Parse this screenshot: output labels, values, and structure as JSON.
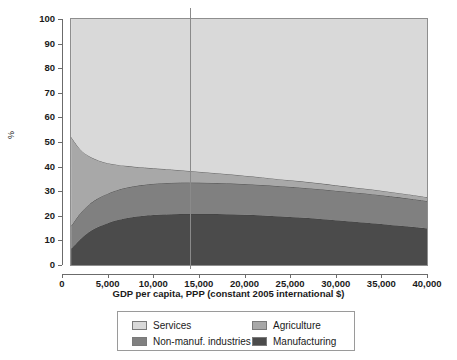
{
  "chart_data": {
    "type": "area",
    "title": "",
    "subtitle": "",
    "xlabel": "GDP per capita, PPP (constant 2005 international $)",
    "ylabel": "%",
    "stacked": true,
    "stack_order_bottom_to_top": [
      "Manufacturing",
      "Non-manuf. industries",
      "Agriculture",
      "Services"
    ],
    "xlim": [
      0,
      40000
    ],
    "ylim": [
      0,
      100
    ],
    "xticks": [
      0,
      5000,
      10000,
      15000,
      20000,
      25000,
      30000,
      35000,
      40000
    ],
    "xtick_labels": [
      "0",
      "5,000",
      "10,000",
      "15,000",
      "20,000",
      "25,000",
      "30,000",
      "35,000",
      "40,000"
    ],
    "yticks": [
      0,
      10,
      20,
      30,
      40,
      50,
      60,
      70,
      80,
      90,
      100
    ],
    "ytick_labels": [
      "0",
      "10",
      "20",
      "30",
      "40",
      "50",
      "60",
      "70",
      "80",
      "90",
      "100"
    ],
    "grid": false,
    "legend_position": "below-axes",
    "data_x_start": 1000,
    "data_x_end": 40000,
    "x": [
      1000,
      2000,
      3000,
      4000,
      5000,
      6000,
      7000,
      8000,
      9000,
      10000,
      12000,
      14000,
      16000,
      18000,
      20000,
      22000,
      24000,
      26000,
      28000,
      30000,
      32000,
      34000,
      36000,
      38000,
      40000
    ],
    "series": [
      {
        "name": "Manufacturing",
        "color": "#4b4b4b",
        "values": [
          6.5,
          10.5,
          13.5,
          15.5,
          17.0,
          18.2,
          19.0,
          19.6,
          20.0,
          20.3,
          20.6,
          20.7,
          20.7,
          20.6,
          20.4,
          20.1,
          19.7,
          19.3,
          18.8,
          18.2,
          17.6,
          17.0,
          16.3,
          15.6,
          14.8
        ]
      },
      {
        "name": "Non-manuf. industries",
        "color": "#808080",
        "values": [
          9.3,
          10.5,
          11.2,
          11.7,
          12.0,
          12.2,
          12.4,
          12.5,
          12.6,
          12.7,
          12.8,
          12.8,
          12.7,
          12.6,
          12.5,
          12.4,
          12.3,
          12.2,
          12.1,
          12.0,
          11.9,
          11.8,
          11.6,
          11.4,
          11.2
        ]
      },
      {
        "name": "Agriculture",
        "color": "#a8a8a8",
        "values": [
          36.2,
          26.0,
          19.5,
          15.3,
          12.4,
          10.4,
          8.9,
          7.8,
          7.0,
          6.3,
          5.4,
          4.7,
          4.2,
          3.8,
          3.4,
          3.1,
          2.8,
          2.6,
          2.4,
          2.2,
          2.0,
          1.9,
          1.8,
          1.7,
          1.6
        ]
      },
      {
        "name": "Services",
        "color": "#d9d9d9",
        "values": [
          48.0,
          53.0,
          55.8,
          57.5,
          58.6,
          59.2,
          59.7,
          60.1,
          60.4,
          60.7,
          61.2,
          61.8,
          62.4,
          63.0,
          63.7,
          64.4,
          65.2,
          65.9,
          66.7,
          67.6,
          68.5,
          69.3,
          70.3,
          71.3,
          72.4
        ]
      }
    ],
    "cumulative_top_boundaries": {
      "manufacturing_top": [
        6.5,
        10.5,
        13.5,
        15.5,
        17.0,
        18.2,
        19.0,
        19.6,
        20.0,
        20.3,
        20.6,
        20.7,
        20.7,
        20.6,
        20.4,
        20.1,
        19.7,
        19.3,
        18.8,
        18.2,
        17.6,
        17.0,
        16.3,
        15.6,
        14.8
      ],
      "nonmanuf_top": [
        15.8,
        21.0,
        24.7,
        27.2,
        29.0,
        30.4,
        31.4,
        32.1,
        32.6,
        33.0,
        33.4,
        33.5,
        33.4,
        33.2,
        32.9,
        32.5,
        32.0,
        31.5,
        30.9,
        30.2,
        29.5,
        28.8,
        27.9,
        27.0,
        26.0
      ],
      "agriculture_top": [
        52.0,
        47.0,
        44.2,
        42.5,
        41.4,
        40.8,
        40.3,
        39.9,
        39.6,
        39.3,
        38.8,
        38.2,
        37.6,
        37.0,
        36.3,
        35.6,
        34.8,
        34.1,
        33.3,
        32.4,
        31.5,
        30.7,
        29.7,
        28.7,
        27.6
      ],
      "services_top": [
        100,
        100,
        100,
        100,
        100,
        100,
        100,
        100,
        100,
        100,
        100,
        100,
        100,
        100,
        100,
        100,
        100,
        100,
        100,
        100,
        100,
        100,
        100,
        100,
        100
      ]
    },
    "annotations": [
      {
        "name": "reference-line",
        "type": "vline",
        "x_value": 14000,
        "color": "#8a8a8a"
      }
    ]
  },
  "axes": {
    "y_title": "%",
    "x_title": "GDP per capita, PPP (constant 2005 international $)",
    "ytick_labels": [
      "100",
      "90",
      "80",
      "70",
      "60",
      "50",
      "40",
      "30",
      "20",
      "10",
      "0"
    ],
    "xtick_labels": [
      "0",
      "5,000",
      "10,000",
      "15,000",
      "20,000",
      "25,000",
      "30,000",
      "35,000",
      "40,000"
    ]
  },
  "legend": {
    "entries": [
      {
        "label": "Services",
        "color": "#d9d9d9"
      },
      {
        "label": "Agriculture",
        "color": "#a8a8a8"
      },
      {
        "label": "Non-manuf. industries",
        "color": "#808080"
      },
      {
        "label": "Manufacturing",
        "color": "#4b4b4b"
      }
    ]
  },
  "colors": {
    "services": "#d9d9d9",
    "agriculture": "#a8a8a8",
    "non_manuf_industries": "#808080",
    "manufacturing": "#4b4b4b",
    "axis": "#6b6b6b",
    "frame": "#8e8e8e",
    "reference_line": "#8a8a8a",
    "background": "#ffffff"
  }
}
